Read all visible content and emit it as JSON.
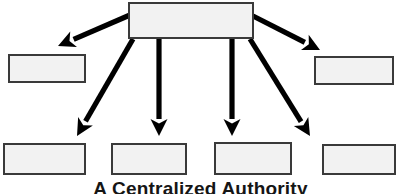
{
  "diagram": {
    "caption": "A Centralized Authority",
    "caption_top_px": 178,
    "colors": {
      "background": "#ffffff",
      "box_fill": "#f2f2f2",
      "box_border": "#3a3a3a",
      "arrow": "#000000",
      "caption_text": "#151515"
    },
    "root": {
      "label": "",
      "x": 128,
      "y": 2,
      "w": 126,
      "h": 37
    },
    "nodes": [
      {
        "id": "left-middle",
        "label": "",
        "x": 8,
        "y": 54,
        "w": 78,
        "h": 29
      },
      {
        "id": "right-middle",
        "label": "",
        "x": 314,
        "y": 56,
        "w": 80,
        "h": 29
      },
      {
        "id": "bottom-one",
        "label": "",
        "x": 3,
        "y": 143,
        "w": 83,
        "h": 32
      },
      {
        "id": "bottom-two",
        "label": "",
        "x": 111,
        "y": 143,
        "w": 76,
        "h": 32
      },
      {
        "id": "bottom-three",
        "label": "",
        "x": 214,
        "y": 142,
        "w": 78,
        "h": 33
      },
      {
        "id": "bottom-four",
        "label": "",
        "x": 322,
        "y": 144,
        "w": 74,
        "h": 31
      }
    ],
    "arrows": [
      {
        "id": "arrow-to-left-middle",
        "from": "root",
        "to": "left-middle",
        "x1": 130,
        "y1": 15,
        "x2": 58,
        "y2": 46
      },
      {
        "id": "arrow-to-right-middle",
        "from": "root",
        "to": "right-middle",
        "x1": 253,
        "y1": 16,
        "x2": 320,
        "y2": 50
      },
      {
        "id": "arrow-to-bottom-one",
        "from": "root",
        "to": "bottom-one",
        "x1": 133,
        "y1": 39,
        "x2": 77,
        "y2": 136
      },
      {
        "id": "arrow-to-bottom-two",
        "from": "root",
        "to": "bottom-two",
        "x1": 159,
        "y1": 39,
        "x2": 159,
        "y2": 136
      },
      {
        "id": "arrow-to-bottom-three",
        "from": "root",
        "to": "bottom-three",
        "x1": 232,
        "y1": 39,
        "x2": 232,
        "y2": 136
      },
      {
        "id": "arrow-to-bottom-four",
        "from": "root",
        "to": "bottom-four",
        "x1": 250,
        "y1": 39,
        "x2": 310,
        "y2": 136
      }
    ]
  }
}
